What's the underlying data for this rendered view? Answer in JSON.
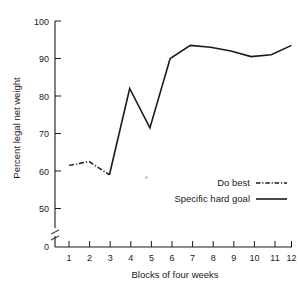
{
  "chart_data": {
    "type": "line",
    "title": "",
    "subtitle": "",
    "xlabel": "Blocks of four weeks",
    "ylabel": "Percent legal net weight",
    "x": [
      1,
      2,
      3,
      4,
      5,
      6,
      7,
      8,
      9,
      10,
      11,
      12
    ],
    "categories": [
      "1",
      "2",
      "3",
      "4",
      "5",
      "6",
      "7",
      "8",
      "9",
      "10",
      "11",
      "12"
    ],
    "xtick_labels": [
      "1",
      "2",
      "3",
      "4",
      "5",
      "6",
      "7",
      "8",
      "9",
      "10",
      "11",
      "12"
    ],
    "ytick_labels": [
      "0",
      "50",
      "60",
      "70",
      "80",
      "90",
      "100"
    ],
    "ytick_values": [
      0,
      50,
      60,
      70,
      80,
      90,
      100
    ],
    "ylim": [
      50,
      100
    ],
    "xlim": [
      1,
      12
    ],
    "y_axis_break": true,
    "y_axis_break_label": "0",
    "grid": false,
    "legend_position": "inside-lower-right",
    "series": [
      {
        "name": "Do best",
        "style": "dash-dot",
        "color": "#1a1a1a",
        "x": [
          1,
          2,
          3
        ],
        "values": [
          61.5,
          62.5,
          59.0
        ]
      },
      {
        "name": "Specific hard goal",
        "style": "solid",
        "color": "#1a1a1a",
        "x": [
          3,
          4,
          5,
          6,
          7,
          8,
          9,
          10,
          11,
          12
        ],
        "values": [
          59.0,
          82.0,
          71.5,
          90.0,
          93.5,
          93.0,
          92.0,
          90.5,
          91.0,
          93.5
        ]
      }
    ],
    "annotations": []
  },
  "legend": {
    "entries": [
      {
        "label": "Do best",
        "style": "dash-dot"
      },
      {
        "label": "Specific hard goal",
        "style": "solid"
      }
    ]
  },
  "axes": {
    "x_title": "Blocks of four weeks",
    "y_title": "Percent legal net weight"
  }
}
